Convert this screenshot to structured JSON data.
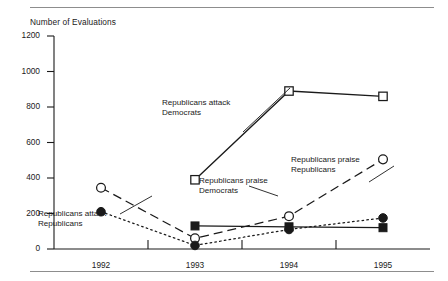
{
  "figure": {
    "axis_title": "Number of Evaluations",
    "rules": {
      "top": true,
      "bottom": true,
      "color": "#8d8d8d"
    }
  },
  "chart_data": {
    "type": "line",
    "title": "",
    "subtitle": "",
    "xlabel": "",
    "ylabel": "Number of Evaluations",
    "categories": [
      "1992",
      "1993",
      "1994",
      "1995"
    ],
    "x_tick_labels": [
      "1992",
      "1993",
      "1994",
      "1995"
    ],
    "y_tick_labels": [
      "0",
      "200",
      "400",
      "600",
      "800",
      "1000",
      "1200"
    ],
    "y_ticks": [
      0,
      200,
      400,
      600,
      800,
      1000,
      1200
    ],
    "ylim": [
      0,
      1200
    ],
    "grid": false,
    "legend_position": "inline-annotations",
    "series": [
      {
        "name": "Republicans attack Democrats",
        "marker": "open-square",
        "line_style": "solid",
        "color": "#1a1a1a",
        "x": [
          "1993",
          "1994",
          "1995"
        ],
        "values": [
          390,
          890,
          860
        ]
      },
      {
        "name": "Republicans praise Republicans",
        "marker": "open-circle",
        "line_style": "dashed",
        "color": "#1a1a1a",
        "x": [
          "1992",
          "1993",
          "1994",
          "1995"
        ],
        "values": [
          345,
          60,
          185,
          505
        ]
      },
      {
        "name": "Republicans attack Republicans",
        "marker": "filled-circle",
        "line_style": "dotted",
        "color": "#1a1a1a",
        "x": [
          "1992",
          "1993",
          "1994",
          "1995"
        ],
        "values": [
          210,
          20,
          110,
          175
        ]
      },
      {
        "name": "Republicans praise Democrats",
        "marker": "filled-square",
        "line_style": "solid",
        "color": "#1a1a1a",
        "x": [
          "1993",
          "1994",
          "1995"
        ],
        "values": [
          130,
          125,
          120
        ]
      }
    ],
    "annotations": [
      {
        "id": "republicans-attack-democrats",
        "text": "Republicans attack\nDemocrats",
        "series": "Republicans attack Democrats"
      },
      {
        "id": "republicans-praise-democrats",
        "text": "Republicans praise\nDemocrats",
        "series": "Republicans praise Democrats"
      },
      {
        "id": "republicans-praise-republicans",
        "text": "Republicans praise\nRepublicans",
        "series": "Republicans praise Republicans"
      },
      {
        "id": "republicans-attack-republicans",
        "text": "Republicans attack\nRepublicans",
        "series": "Republicans attack Republicans"
      }
    ]
  }
}
